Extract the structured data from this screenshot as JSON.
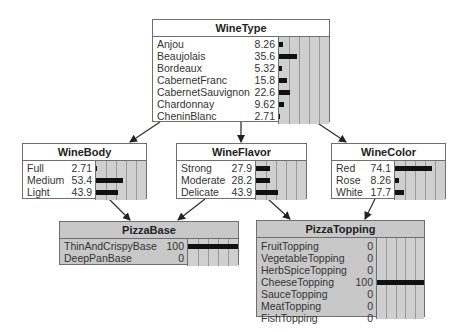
{
  "nodes": {
    "winetype": {
      "title": "WineType",
      "observed": false,
      "states": [
        {
          "label": "Anjou",
          "value": "8.26",
          "pct": 8.26
        },
        {
          "label": "Beaujolais",
          "value": "35.6",
          "pct": 35.6
        },
        {
          "label": "Bordeaux",
          "value": "5.32",
          "pct": 5.32
        },
        {
          "label": "CabernetFranc",
          "value": "15.8",
          "pct": 15.8
        },
        {
          "label": "CabernetSauvignon",
          "value": "22.6",
          "pct": 22.6
        },
        {
          "label": "Chardonnay",
          "value": "9.62",
          "pct": 9.62
        },
        {
          "label": "CheninBlanc",
          "value": "2.71",
          "pct": 2.71
        }
      ]
    },
    "winebody": {
      "title": "WineBody",
      "observed": false,
      "states": [
        {
          "label": "Full",
          "value": "2.71",
          "pct": 2.71
        },
        {
          "label": "Medium",
          "value": "53.4",
          "pct": 53.4
        },
        {
          "label": "Light",
          "value": "43.9",
          "pct": 43.9
        }
      ]
    },
    "wineflavor": {
      "title": "WineFlavor",
      "observed": false,
      "states": [
        {
          "label": "Strong",
          "value": "27.9",
          "pct": 27.9
        },
        {
          "label": "Moderate",
          "value": "28.2",
          "pct": 28.2
        },
        {
          "label": "Delicate",
          "value": "43.9",
          "pct": 43.9
        }
      ]
    },
    "winecolor": {
      "title": "WineColor",
      "observed": false,
      "states": [
        {
          "label": "Red",
          "value": "74.1",
          "pct": 74.1
        },
        {
          "label": "Rose",
          "value": "8.26",
          "pct": 8.26
        },
        {
          "label": "White",
          "value": "17.7",
          "pct": 17.7
        }
      ]
    },
    "pizzabase": {
      "title": "PizzaBase",
      "observed": true,
      "states": [
        {
          "label": "ThinAndCrispyBase",
          "value": "100",
          "pct": 100
        },
        {
          "label": "DeepPanBase",
          "value": "0",
          "pct": 0
        }
      ]
    },
    "pizzatopping": {
      "title": "PizzaTopping",
      "observed": true,
      "states": [
        {
          "label": "FruitTopping",
          "value": "0",
          "pct": 0
        },
        {
          "label": "VegetableTopping",
          "value": "0",
          "pct": 0
        },
        {
          "label": "HerbSpiceTopping",
          "value": "0",
          "pct": 0
        },
        {
          "label": "CheeseTopping",
          "value": "100",
          "pct": 100
        },
        {
          "label": "SauceTopping",
          "value": "0",
          "pct": 0
        },
        {
          "label": "MeatTopping",
          "value": "0",
          "pct": 0
        },
        {
          "label": "FishTopping",
          "value": "0",
          "pct": 0
        }
      ]
    }
  },
  "edges": [
    {
      "from": "WineType",
      "to": "WineBody"
    },
    {
      "from": "WineType",
      "to": "WineFlavor"
    },
    {
      "from": "WineType",
      "to": "WineColor"
    },
    {
      "from": "WineBody",
      "to": "PizzaBase"
    },
    {
      "from": "WineFlavor",
      "to": "PizzaBase"
    },
    {
      "from": "WineFlavor",
      "to": "PizzaTopping"
    },
    {
      "from": "WineColor",
      "to": "PizzaTopping"
    }
  ],
  "colors": {
    "node_bg": "#ffffff",
    "observed_bg": "#c8c8c8",
    "bar_area": "#cfcfcf",
    "bar": "#111111",
    "border": "#6f6f6f"
  }
}
